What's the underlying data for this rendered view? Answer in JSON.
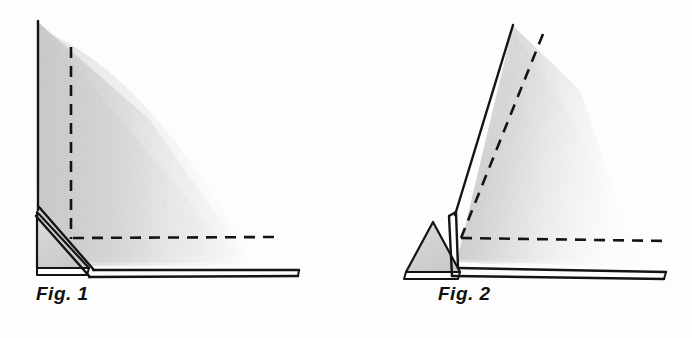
{
  "page": {
    "width": 692,
    "height": 338,
    "background_color": "#fdfdfd"
  },
  "ink_color": "#141414",
  "shade_color": "#d8d8d8",
  "figures": [
    {
      "id": "fig1",
      "caption": "Fig. 1",
      "state": "upright",
      "panel_angle_deg": 90,
      "shading": "gray gradient fading right",
      "dashed_lines": [
        "vertical",
        "horizontal"
      ],
      "parts": [
        "upright-panel",
        "base-panel",
        "triangular-hinge-flap"
      ]
    },
    {
      "id": "fig2",
      "caption": "Fig. 2",
      "state": "tilted",
      "panel_angle_deg": 72,
      "shading": "gray gradient fading right",
      "dashed_lines": [
        "tilted",
        "horizontal"
      ],
      "parts": [
        "tilted-panel",
        "base-panel",
        "triangular-hinge-flap"
      ]
    }
  ]
}
